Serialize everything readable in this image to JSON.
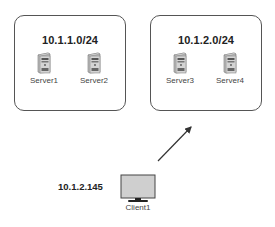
{
  "subnets": [
    {
      "label": "10.1.1.0/24",
      "servers": [
        {
          "name": "Server1",
          "icon": "server-tower-icon"
        },
        {
          "name": "Server2",
          "icon": "server-tower-icon"
        }
      ]
    },
    {
      "label": "10.1.2.0/24",
      "servers": [
        {
          "name": "Server3",
          "icon": "server-tower-icon"
        },
        {
          "name": "Server4",
          "icon": "server-tower-icon"
        }
      ]
    }
  ],
  "client": {
    "name": "Client1",
    "ip": "10.1.2.145",
    "icon": "monitor-icon"
  },
  "arrow": {
    "from": "Client1",
    "to": "10.1.2.0/24",
    "color": "#333333"
  },
  "colors": {
    "box_border": "#555555",
    "server_body": "#c8c8c8",
    "monitor_screen": "#cfcfcf",
    "text": "#222222"
  }
}
